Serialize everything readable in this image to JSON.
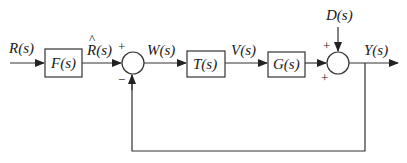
{
  "diagram": {
    "type": "control-system-block-diagram",
    "signals": {
      "input": "R(s)",
      "prefiltered": "R(s)",
      "prefiltered_hat": "^",
      "error": "W(s)",
      "control": "V(s)",
      "disturbance": "D(s)",
      "output": "Y(s)"
    },
    "blocks": [
      {
        "id": "F",
        "label": "F(s)"
      },
      {
        "id": "T",
        "label": "T(s)"
      },
      {
        "id": "G",
        "label": "G(s)"
      }
    ],
    "summing_junctions": [
      {
        "id": "sum1",
        "signs": {
          "left": "+",
          "bottom": "−"
        }
      },
      {
        "id": "sum2",
        "signs": {
          "top": "+",
          "left": "+"
        }
      }
    ],
    "feedback": "unity negative feedback from Y(s) to first summing junction"
  }
}
